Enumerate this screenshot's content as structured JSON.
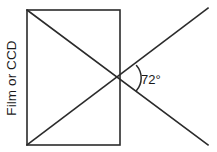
{
  "figure": {
    "sensor_label": "Film or CCD",
    "angle_label": "72°",
    "angle_value": 72,
    "angle_unit": "degrees",
    "colors": {
      "background": "#ffffff",
      "line": "#2b2b2b",
      "text": "#1a1a1a"
    },
    "geometry": {
      "rectangle": {
        "left": 27,
        "right": 120,
        "top": 10,
        "bottom": 145
      },
      "diagonal_rising": {
        "from_x": 27,
        "from_y": 145,
        "to_x": 208,
        "to_y": 8
      },
      "diagonal_falling": {
        "from_x": 27,
        "from_y": 10,
        "to_x": 208,
        "to_y": 145
      },
      "vertex": {
        "x": 120,
        "y": 78
      },
      "arc": {
        "center_x": 120,
        "center_y": 78,
        "radius": 18
      }
    },
    "label_positions": {
      "sensor_label_x": 16,
      "sensor_label_y": 78,
      "angle_label_x": 141,
      "angle_label_y": 83
    }
  }
}
